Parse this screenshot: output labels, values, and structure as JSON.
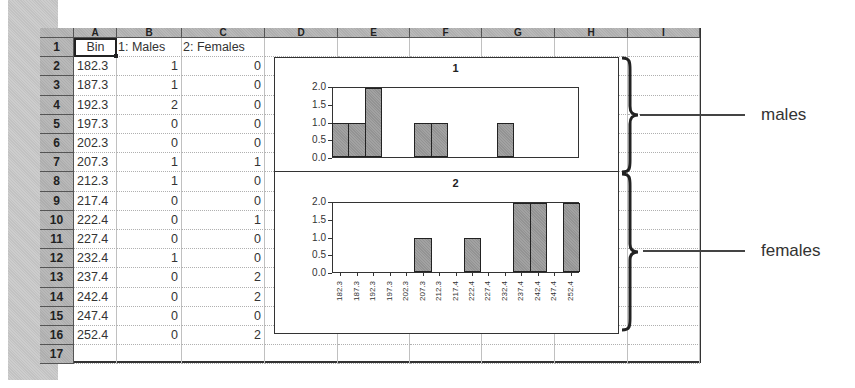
{
  "spreadsheet": {
    "column_headers": [
      "A",
      "B",
      "C",
      "D",
      "E",
      "F",
      "G",
      "H",
      "I"
    ],
    "row_headers": [
      "1",
      "2",
      "3",
      "4",
      "5",
      "6",
      "7",
      "8",
      "9",
      "10",
      "11",
      "12",
      "13",
      "14",
      "15",
      "16",
      "17"
    ],
    "header_row": {
      "A": "Bin",
      "B": "1: Males",
      "C": "2: Females"
    },
    "selected_cell": "A1",
    "rows": [
      {
        "bin": "182.3",
        "males": "1",
        "females": "0"
      },
      {
        "bin": "187.3",
        "males": "1",
        "females": "0"
      },
      {
        "bin": "192.3",
        "males": "2",
        "females": "0"
      },
      {
        "bin": "197.3",
        "males": "0",
        "females": "0"
      },
      {
        "bin": "202.3",
        "males": "0",
        "females": "0"
      },
      {
        "bin": "207.3",
        "males": "1",
        "females": "1"
      },
      {
        "bin": "212.3",
        "males": "1",
        "females": "0"
      },
      {
        "bin": "217.4",
        "males": "0",
        "females": "0"
      },
      {
        "bin": "222.4",
        "males": "0",
        "females": "1"
      },
      {
        "bin": "227.4",
        "males": "0",
        "females": "0"
      },
      {
        "bin": "232.4",
        "males": "1",
        "females": "0"
      },
      {
        "bin": "237.4",
        "males": "0",
        "females": "2"
      },
      {
        "bin": "242.4",
        "males": "0",
        "females": "2"
      },
      {
        "bin": "247.4",
        "males": "0",
        "females": "0"
      },
      {
        "bin": "252.4",
        "males": "0",
        "females": "2"
      }
    ]
  },
  "annotations": {
    "males_label": "males",
    "females_label": "females"
  },
  "chart_data": [
    {
      "type": "bar",
      "title": "1",
      "categories": [
        "182.3",
        "187.3",
        "192.3",
        "197.3",
        "202.3",
        "207.3",
        "212.3",
        "217.4",
        "222.4",
        "227.4",
        "232.4",
        "237.4",
        "242.4",
        "247.4",
        "252.4"
      ],
      "values": [
        1,
        1,
        2,
        0,
        0,
        1,
        1,
        0,
        0,
        0,
        1,
        0,
        0,
        0,
        0
      ],
      "xlabel": "",
      "ylabel": "",
      "yticks": [
        "0.0",
        "0.5",
        "1.0",
        "1.5",
        "2.0"
      ],
      "ylim": [
        0,
        2
      ],
      "grid": false,
      "legend": null
    },
    {
      "type": "bar",
      "title": "2",
      "categories": [
        "182.3",
        "187.3",
        "192.3",
        "197.3",
        "202.3",
        "207.3",
        "212.3",
        "217.4",
        "222.4",
        "227.4",
        "232.4",
        "237.4",
        "242.4",
        "247.4",
        "252.4"
      ],
      "values": [
        0,
        0,
        0,
        0,
        0,
        1,
        0,
        0,
        1,
        0,
        0,
        2,
        2,
        0,
        2
      ],
      "xlabel": "",
      "ylabel": "",
      "yticks": [
        "0.0",
        "0.5",
        "1.0",
        "1.5",
        "2.0"
      ],
      "ylim": [
        0,
        2
      ],
      "grid": false,
      "legend": null
    }
  ]
}
